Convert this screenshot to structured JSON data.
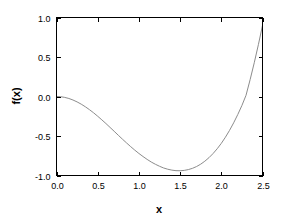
{
  "chart_data": {
    "type": "line",
    "title": "",
    "xlabel": "x",
    "ylabel": "f(x)",
    "xlim": [
      0.0,
      2.5
    ],
    "ylim": [
      -1.0,
      1.0
    ],
    "grid": false,
    "legend": null,
    "xticks": [
      "0.0",
      "0.5",
      "1.0",
      "1.5",
      "2.0",
      "2.5"
    ],
    "xtick_values": [
      0.0,
      0.5,
      1.0,
      1.5,
      2.0,
      2.5
    ],
    "yticks": [
      "-1.0",
      "-0.5",
      "0.0",
      "0.5",
      "1.0"
    ],
    "ytick_values": [
      -1.0,
      -0.5,
      0.0,
      0.5,
      1.0
    ],
    "series": [
      {
        "name": "f(x)",
        "color": "#8c8c8c",
        "linewidth": 1,
        "x": [
          0.0,
          0.05,
          0.1,
          0.15,
          0.2,
          0.25,
          0.3,
          0.35,
          0.4,
          0.45,
          0.5,
          0.55,
          0.6,
          0.65,
          0.7,
          0.75,
          0.8,
          0.85,
          0.9,
          0.95,
          1.0,
          1.05,
          1.1,
          1.15,
          1.2,
          1.25,
          1.3,
          1.35,
          1.4,
          1.45,
          1.5,
          1.55,
          1.6,
          1.65,
          1.7,
          1.75,
          1.8,
          1.85,
          1.9,
          1.95,
          2.0,
          2.05,
          2.1,
          2.15,
          2.2,
          2.25,
          2.3,
          2.35,
          2.4,
          2.45,
          2.5
        ],
        "y": [
          0.0,
          -0.002,
          -0.01,
          -0.022,
          -0.039,
          -0.06,
          -0.085,
          -0.114,
          -0.146,
          -0.181,
          -0.219,
          -0.259,
          -0.3,
          -0.343,
          -0.386,
          -0.43,
          -0.473,
          -0.515,
          -0.556,
          -0.595,
          -0.632,
          -0.666,
          -0.698,
          -0.727,
          -0.752,
          -0.774,
          -0.793,
          -0.807,
          -0.817,
          -0.823,
          -0.824,
          -0.82,
          -0.811,
          -0.797,
          -0.777,
          -0.751,
          -0.718,
          -0.679,
          -0.633,
          -0.58,
          -0.52,
          -0.452,
          -0.376,
          -0.292,
          -0.2,
          -0.1,
          0.009,
          0.127,
          0.254,
          0.39,
          0.535
        ]
      }
    ],
    "key_points": {
      "start": {
        "x": 0.0,
        "y": 0.0
      },
      "minimum": {
        "x": 1.32,
        "y": -0.94
      },
      "zero_crossing": {
        "x": 2.1,
        "y": 0.0
      },
      "end": {
        "x": 2.5,
        "y": 0.9
      }
    }
  },
  "axes": {
    "x_title": "x",
    "y_title": "f(x)"
  }
}
